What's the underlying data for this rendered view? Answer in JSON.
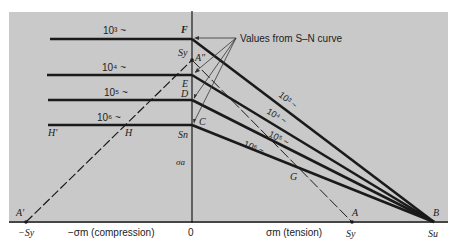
{
  "figure": {
    "type": "modified Goodman diagram",
    "background_color": "#c9c9c9",
    "line_color": "#1a1a1a",
    "annotation": "Values from S–N curve",
    "axes": {
      "vertical_label": "σa",
      "origin_label": "0",
      "neg_label": "−σm (compression)",
      "pos_label": "σm (tension)",
      "neg_sy": "−Sy",
      "pos_sy": "Sy",
      "su": "Su"
    },
    "cycle_lines": [
      {
        "label": "10³ ~",
        "right_label": "10³ ~",
        "point": "F"
      },
      {
        "label": "10⁴ ~",
        "right_label": "10⁴ ~",
        "point": "E"
      },
      {
        "label": "10⁵ ~",
        "right_label": "10⁵ ~",
        "point": "D"
      },
      {
        "label": "10⁶ ~",
        "right_label": "10⁶ ~",
        "point": "C"
      }
    ],
    "points": {
      "F": "F",
      "Sy_axis": "Sy",
      "A2": "A″",
      "E": "E",
      "D": "D",
      "C": "C",
      "Sn": "Sn",
      "H1": "H′",
      "H": "H",
      "G": "G",
      "A1": "A′",
      "A": "A",
      "B": "B"
    }
  }
}
